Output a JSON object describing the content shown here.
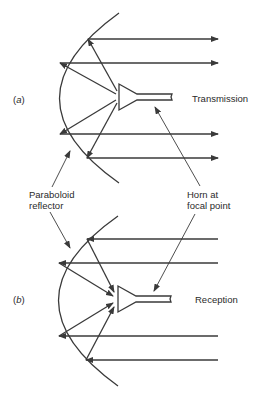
{
  "diagram": {
    "panel_a": {
      "tag_open": "(",
      "tag_letter": "a",
      "tag_close": ")",
      "label": "Transmission"
    },
    "panel_b": {
      "tag_open": "(",
      "tag_letter": "b",
      "tag_close": ")",
      "label": "Reception"
    },
    "annotations": {
      "reflector_line1": "Paraboloid",
      "reflector_line2": "reflector",
      "horn_line1": "Horn at",
      "horn_line2": "focal point"
    },
    "colors": {
      "stroke": "#3a3a3a",
      "text": "#2a2a2a",
      "background": "#ffffff"
    }
  }
}
